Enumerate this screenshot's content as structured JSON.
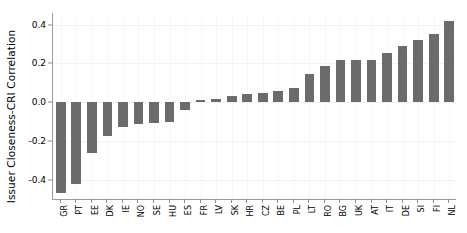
{
  "chart_data": {
    "type": "bar",
    "title": "",
    "subtitle": "",
    "xlabel": "",
    "ylabel": "Issuer Closeness-CRI Correlation",
    "ylim": [
      -0.5,
      0.46
    ],
    "yticks": [
      0.4,
      0.2,
      0.0,
      -0.2,
      -0.4
    ],
    "ytick_labels": [
      "0.4",
      "0.2",
      "0.0",
      "-0.2",
      "-0.4"
    ],
    "grid": true,
    "legend": null,
    "bar_color": "#6b6b6b",
    "categories": [
      "GR",
      "PT",
      "EE",
      "DK",
      "IE",
      "NO",
      "SE",
      "HU",
      "ES",
      "FR",
      "LV",
      "SK",
      "HR",
      "CZ",
      "BE",
      "PL",
      "LT",
      "RO",
      "BG",
      "UK",
      "AT",
      "IT",
      "DE",
      "SI",
      "FI",
      "NL"
    ],
    "values": [
      -0.47,
      -0.42,
      -0.265,
      -0.175,
      -0.13,
      -0.115,
      -0.11,
      -0.105,
      -0.04,
      0.01,
      0.015,
      0.03,
      0.04,
      0.045,
      0.055,
      0.075,
      0.145,
      0.185,
      0.215,
      0.22,
      0.22,
      0.255,
      0.29,
      0.32,
      0.35,
      0.42
    ]
  }
}
